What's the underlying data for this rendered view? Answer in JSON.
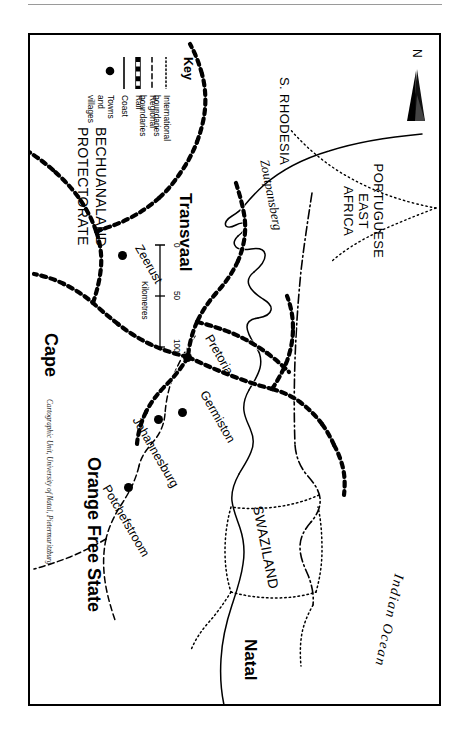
{
  "page": {
    "ghost_header": "· ·   ·     ·        ·",
    "background": "#ffffff",
    "ink": "#000000"
  },
  "map": {
    "orientation_note": "map printed rotated 90 degrees clockwise on the page",
    "north_arrow": {
      "label": "N",
      "icon": "north-arrow-icon"
    },
    "credit": "Cartographic Unit, University of Natal, Pietermaritzburg",
    "regions": [
      {
        "id": "portuguese-east-africa",
        "name": "PORTUGUESE\nEAST\nAFRICA",
        "lines": [
          "PORTUGUESE",
          "EAST",
          "AFRICA"
        ],
        "style": "caps"
      },
      {
        "id": "s-rhodesia",
        "name": "S. RHODESIA",
        "lines": [
          "S. RHODESIA"
        ],
        "style": "caps"
      },
      {
        "id": "transvaal",
        "name": "Transvaal",
        "lines": [
          "Transvaal"
        ],
        "style": "bold"
      },
      {
        "id": "swaziland",
        "name": "SWAZILAND",
        "lines": [
          "SWAZILAND"
        ],
        "style": "caps"
      },
      {
        "id": "natal",
        "name": "Natal",
        "lines": [
          "Natal"
        ],
        "style": "bold"
      },
      {
        "id": "orange-free-state",
        "name": "Orange Free State",
        "lines": [
          "Orange Free State"
        ],
        "style": "bold"
      },
      {
        "id": "bechuanaland-protectorate",
        "name": "BECHUANALAND PROTECTORATE",
        "lines": [
          "BECHUANALAND",
          "PROTECTORATE"
        ],
        "style": "caps"
      },
      {
        "id": "cape",
        "name": "Cape",
        "lines": [
          "Cape"
        ],
        "style": "bold"
      }
    ],
    "physical_features": [
      {
        "id": "indian-ocean",
        "name": "Indian Ocean",
        "style": "italic"
      },
      {
        "id": "zoutpansberg",
        "name": "Zoutpansberg",
        "style": "italic"
      }
    ],
    "cities": [
      {
        "id": "pretoria",
        "name": "Pretoria"
      },
      {
        "id": "germiston",
        "name": "Germiston"
      },
      {
        "id": "johannesburg",
        "name": "Johannesburg"
      },
      {
        "id": "potchefstroom",
        "name": "Potchefstroom"
      },
      {
        "id": "zeerust",
        "name": "Zeerust"
      }
    ]
  },
  "key": {
    "title": "Key",
    "items": [
      {
        "id": "international-boundaries",
        "label": "International boundaries",
        "symbol": "dotted-line-symbol"
      },
      {
        "id": "regional-boundaries",
        "label": "Regional boundaries",
        "symbol": "dashed-line-symbol"
      },
      {
        "id": "rail",
        "label": "Rail",
        "symbol": "rail-line-symbol"
      },
      {
        "id": "coast",
        "label": "Coast",
        "symbol": "solid-line-symbol"
      },
      {
        "id": "towns-and-villages",
        "label": "Towns and villages",
        "symbol": "filled-circle-symbol"
      }
    ]
  },
  "scale": {
    "unit_label": "Kilometres",
    "ticks": [
      "0",
      "50",
      "100"
    ],
    "min": 0,
    "max": 100
  }
}
